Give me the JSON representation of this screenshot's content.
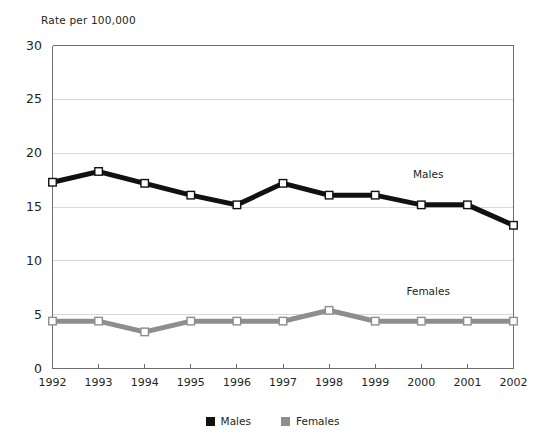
{
  "chart_data": {
    "type": "line",
    "title": "",
    "ylabel": "Rate per 100,000",
    "xlabel": "",
    "categories": [
      "1992",
      "1993",
      "1994",
      "1995",
      "1996",
      "1997",
      "1998",
      "1999",
      "2000",
      "2001",
      "2002"
    ],
    "series": [
      {
        "name": "Males",
        "color": "#111111",
        "values": [
          17.3,
          18.3,
          17.2,
          16.1,
          15.2,
          17.2,
          16.1,
          16.1,
          15.2,
          15.2,
          13.3
        ]
      },
      {
        "name": "Females",
        "color": "#8e8e8e",
        "values": [
          4.4,
          4.4,
          3.4,
          4.4,
          4.4,
          4.4,
          5.4,
          4.4,
          4.4,
          4.4,
          4.4
        ]
      }
    ],
    "ylim": [
      0,
      30
    ],
    "yticks": [
      0,
      5,
      10,
      15,
      20,
      25,
      30
    ],
    "ytick_labels": [
      "0",
      "5",
      "10",
      "15",
      "20",
      "25",
      "30"
    ],
    "grid": true,
    "grid_axis": "y",
    "legend_position": "bottom",
    "annotations": [
      {
        "text": "Males",
        "x_value": 2000.15,
        "y_value": 18.0
      },
      {
        "text": "Females",
        "x_value": 2000.15,
        "y_value": 7.1
      }
    ]
  },
  "legend": {
    "items": [
      {
        "label": "Males",
        "color": "#111111"
      },
      {
        "label": "Females",
        "color": "#8e8e8e"
      }
    ]
  },
  "colors": {
    "males": "#111111",
    "females": "#8e8e8e",
    "grid": "#d9d9d9",
    "axis": "#6d6e70",
    "marker_fill": "#ffffff",
    "text": "#231f20",
    "background": "#ffffff"
  }
}
